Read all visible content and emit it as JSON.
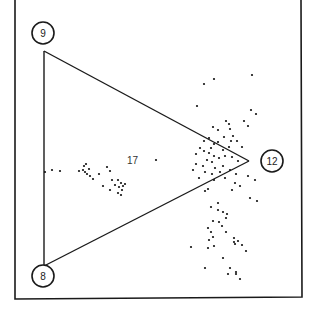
{
  "diagram": {
    "type": "scatter-triangle",
    "frame_color": "#1a1a1a",
    "nodes": [
      {
        "id": "9",
        "label": "9",
        "cx": 43,
        "cy": 33,
        "r": 11
      },
      {
        "id": "8",
        "label": "8",
        "cx": 43,
        "cy": 276,
        "r": 11
      },
      {
        "id": "12",
        "label": "12",
        "cx": 272,
        "cy": 161,
        "r": 11
      }
    ],
    "triangle_vertices": [
      [
        44,
        51
      ],
      [
        44,
        266
      ],
      [
        249,
        161
      ]
    ],
    "annotation": {
      "label": "17",
      "x": 127,
      "y": 164
    },
    "points": [
      [
        204,
        84
      ],
      [
        214,
        79
      ],
      [
        252,
        75
      ],
      [
        197,
        106
      ],
      [
        251,
        110
      ],
      [
        256,
        114
      ],
      [
        226,
        121
      ],
      [
        229,
        124
      ],
      [
        244,
        121
      ],
      [
        248,
        126
      ],
      [
        213,
        127
      ],
      [
        230,
        129
      ],
      [
        218,
        130
      ],
      [
        233,
        136
      ],
      [
        224,
        137
      ],
      [
        209,
        138
      ],
      [
        218,
        142
      ],
      [
        214,
        144
      ],
      [
        204,
        141
      ],
      [
        200,
        148
      ],
      [
        211,
        148
      ],
      [
        204,
        151
      ],
      [
        196,
        154
      ],
      [
        209,
        153
      ],
      [
        214,
        156
      ],
      [
        223,
        150
      ],
      [
        229,
        147
      ],
      [
        231,
        141
      ],
      [
        237,
        141
      ],
      [
        242,
        147
      ],
      [
        207,
        160
      ],
      [
        212,
        162
      ],
      [
        219,
        158
      ],
      [
        225,
        156
      ],
      [
        232,
        157
      ],
      [
        238,
        161
      ],
      [
        196,
        164
      ],
      [
        203,
        166
      ],
      [
        215,
        168
      ],
      [
        223,
        166
      ],
      [
        193,
        170
      ],
      [
        205,
        172
      ],
      [
        212,
        174
      ],
      [
        220,
        172
      ],
      [
        230,
        170
      ],
      [
        236,
        174
      ],
      [
        199,
        178
      ],
      [
        214,
        180
      ],
      [
        225,
        178
      ],
      [
        235,
        183
      ],
      [
        248,
        176
      ],
      [
        255,
        180
      ],
      [
        240,
        186
      ],
      [
        232,
        190
      ],
      [
        208,
        189
      ],
      [
        205,
        191
      ],
      [
        250,
        198
      ],
      [
        257,
        201
      ],
      [
        218,
        203
      ],
      [
        211,
        207
      ],
      [
        218,
        210
      ],
      [
        223,
        212
      ],
      [
        227,
        214
      ],
      [
        226,
        218
      ],
      [
        213,
        221
      ],
      [
        219,
        222
      ],
      [
        222,
        226
      ],
      [
        208,
        228
      ],
      [
        211,
        232
      ],
      [
        226,
        232
      ],
      [
        213,
        237
      ],
      [
        209,
        240
      ],
      [
        234,
        238
      ],
      [
        234,
        242
      ],
      [
        235,
        244
      ],
      [
        238,
        241
      ],
      [
        242,
        245
      ],
      [
        191,
        247
      ],
      [
        246,
        251
      ],
      [
        208,
        248
      ],
      [
        214,
        246
      ],
      [
        223,
        258
      ],
      [
        205,
        268
      ],
      [
        230,
        268
      ],
      [
        228,
        274
      ],
      [
        236,
        274
      ],
      [
        236,
        272
      ],
      [
        240,
        279
      ],
      [
        45,
        172
      ],
      [
        52,
        170
      ],
      [
        60,
        171
      ],
      [
        79,
        171
      ],
      [
        83,
        170
      ],
      [
        85,
        172
      ],
      [
        87,
        174
      ],
      [
        89,
        169
      ],
      [
        84,
        166
      ],
      [
        86,
        164
      ],
      [
        90,
        176
      ],
      [
        93,
        179
      ],
      [
        99,
        174
      ],
      [
        107,
        167
      ],
      [
        110,
        171
      ],
      [
        112,
        180
      ],
      [
        118,
        180
      ],
      [
        121,
        183
      ],
      [
        123,
        186
      ],
      [
        125,
        184
      ],
      [
        119,
        187
      ],
      [
        115,
        185
      ],
      [
        122,
        190
      ],
      [
        118,
        193
      ],
      [
        121,
        195
      ],
      [
        110,
        190
      ],
      [
        103,
        186
      ],
      [
        156,
        160
      ]
    ]
  }
}
